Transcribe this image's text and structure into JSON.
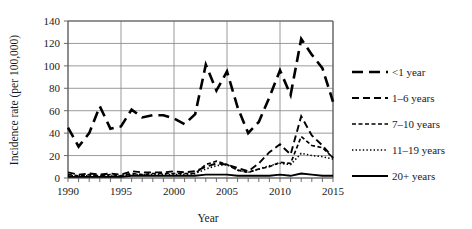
{
  "chart_data": {
    "type": "line",
    "title": "",
    "xlabel": "Year",
    "ylabel": "Incidence rate (per 100,000)",
    "xlim": [
      1990,
      2015
    ],
    "ylim": [
      0,
      140
    ],
    "ytick_step": 20,
    "yticks": [
      "0",
      "20",
      "40",
      "60",
      "80",
      "100",
      "120",
      "140"
    ],
    "xticks": [
      "1990",
      "1995",
      "2000",
      "2005",
      "2010",
      "2015"
    ],
    "xtick_minor_step": 1,
    "grid": "horizontal-and-vertical",
    "legend_position": "right",
    "x": [
      1990,
      1991,
      1992,
      1993,
      1994,
      1995,
      1996,
      1997,
      1998,
      1999,
      2000,
      2001,
      2002,
      2003,
      2004,
      2005,
      2006,
      2007,
      2008,
      2009,
      2010,
      2011,
      2012,
      2013,
      2014,
      2015
    ],
    "series": [
      {
        "name": "<1 year",
        "dash": "long-dash",
        "stroke_width": 2.6,
        "dasharray": "11,6",
        "values": [
          45,
          28,
          40,
          64,
          44,
          46,
          61,
          54,
          56,
          56,
          53,
          48,
          57,
          101,
          78,
          95,
          63,
          40,
          50,
          72,
          96,
          74,
          124,
          110,
          98,
          68
        ]
      },
      {
        "name": "1-6 years",
        "dash": "medium-dash",
        "stroke_width": 1.9,
        "dasharray": "7,4",
        "values": [
          5,
          3,
          4,
          3,
          4,
          3,
          6,
          5,
          5,
          5,
          6,
          5,
          6,
          10,
          13,
          12,
          9,
          6,
          13,
          23,
          30,
          21,
          55,
          38,
          29,
          18
        ]
      },
      {
        "name": "7-10 years",
        "dash": "short-dash",
        "stroke_width": 1.7,
        "dasharray": "4,2.5",
        "values": [
          3,
          2,
          3,
          2,
          3,
          2,
          4,
          3,
          4,
          4,
          4,
          4,
          4,
          12,
          15,
          12,
          7,
          5,
          8,
          10,
          14,
          13,
          37,
          29,
          27,
          18
        ]
      },
      {
        "name": "11-19 years",
        "dash": "dotted",
        "stroke_width": 1.6,
        "dasharray": "1.4,2.2",
        "values": [
          2,
          2,
          2,
          2,
          2,
          2,
          3,
          3,
          3,
          3,
          3,
          3,
          4,
          8,
          11,
          12,
          7,
          5,
          8,
          11,
          13,
          12,
          22,
          20,
          19,
          17
        ]
      },
      {
        "name": "20+ years",
        "dash": "solid",
        "stroke_width": 1.8,
        "dasharray": "none",
        "values": [
          1,
          1,
          1,
          1,
          1,
          1,
          2,
          2,
          2,
          2,
          2,
          2,
          2,
          3,
          3,
          3,
          2,
          2,
          2,
          2,
          3,
          2,
          4,
          3,
          2,
          2
        ]
      }
    ]
  },
  "legend": {
    "items": [
      {
        "label": "<1 year"
      },
      {
        "label": "1–6 years"
      },
      {
        "label": "7–10 years"
      },
      {
        "label": "11–19 years"
      },
      {
        "label": "20+ years"
      }
    ]
  },
  "axes": {
    "y_title": "Incidence rate (per 100,000)",
    "x_title": "Year"
  }
}
